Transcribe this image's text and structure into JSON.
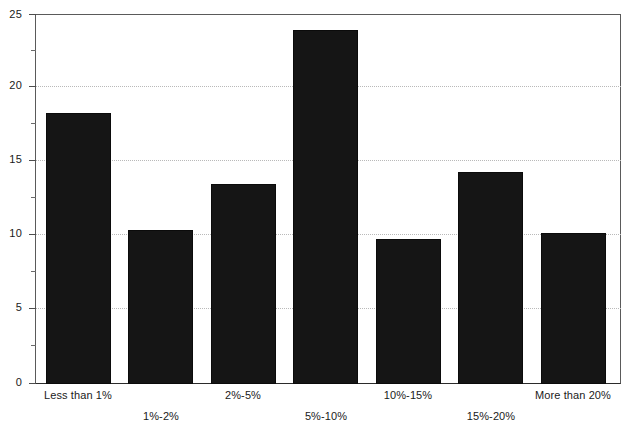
{
  "chart_data": {
    "type": "bar",
    "title": "",
    "subtitle": "",
    "xlabel": "",
    "ylabel": "",
    "categories": [
      "Less than 1%",
      "1%-2%",
      "2%-5%",
      "5%-10%",
      "10%-15%",
      "15%-20%",
      "More than 20%"
    ],
    "values": [
      18.3,
      10.4,
      13.5,
      23.9,
      9.8,
      14.3,
      10.2
    ],
    "ylim": [
      0,
      25
    ],
    "yticks": [
      0,
      5,
      10,
      15,
      20,
      25
    ],
    "ytick_labels": [
      "0",
      "5",
      "10",
      "15",
      "20",
      "25"
    ],
    "yminor_ticks": [
      2.5,
      7.5,
      12.5,
      17.5,
      22.5
    ],
    "grid": true,
    "grid_axis": "y",
    "grid_style": "dotted",
    "legend": null,
    "bar_color": "#151515",
    "series": [
      {
        "name": "",
        "values": [
          18.3,
          10.4,
          13.5,
          23.9,
          9.8,
          14.3,
          10.2
        ]
      }
    ]
  },
  "axis": {
    "y": {
      "labels": [
        {
          "value": "25"
        },
        {
          "value": "20"
        },
        {
          "value": "15"
        },
        {
          "value": "10"
        },
        {
          "value": "5"
        },
        {
          "value": "0"
        }
      ]
    },
    "x": {
      "labels": [
        {
          "text": "Less than 1%",
          "row": "a"
        },
        {
          "text": "1%-2%",
          "row": "b"
        },
        {
          "text": "2%-5%",
          "row": "a"
        },
        {
          "text": "5%-10%",
          "row": "b"
        },
        {
          "text": "10%-15%",
          "row": "a"
        },
        {
          "text": "15%-20%",
          "row": "b"
        },
        {
          "text": "More than 20%",
          "row": "a"
        }
      ]
    }
  }
}
